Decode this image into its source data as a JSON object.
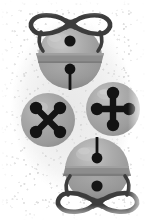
{
  "scene": {
    "title": "Jingle bells and buttons craft illustration",
    "description": "Grayscale illustration of two jingle bells tied with ribbon bows and two round four-hole buttons on a speckled light background",
    "width": 159,
    "height": 220,
    "style": "grayscale-halftone",
    "background": {
      "name": "speckled-paper-texture",
      "base_color": "#ffffff",
      "texture_color": "#eeeeee",
      "speckle_color": "#d6d6d6"
    },
    "palette": {
      "outline_dark": "#3a3a3a",
      "ink_black": "#141414",
      "metal_mid": "#9a9a9a",
      "metal_light": "#b4b4b4",
      "metal_highlight": "#c9c9c9",
      "metal_shadow": "#848484",
      "band_gray": "#8e8e8e",
      "button_face": "#a2a2a2",
      "button_face_light": "#b8b8b8",
      "paper_white": "#ffffff"
    },
    "objects": [
      {
        "id": "bell-top",
        "name": "jingle-bell-top",
        "label": "Jingle bell with bow (upright)",
        "type": "jingle-bell",
        "orientation": "upright",
        "center_x": 70,
        "center_y": 57,
        "radius": 32,
        "has_bow": true,
        "bow_position": "top",
        "parts": [
          "bow-ribbon",
          "bell-body",
          "bell-band",
          "hanger-hole",
          "clapper-stem",
          "clapper-ball"
        ]
      },
      {
        "id": "button-left",
        "name": "button-x-pattern",
        "label": "Four-hole button, X hole pattern",
        "type": "button",
        "hole_count": 4,
        "hole_pattern": "x-cross",
        "center_x": 47,
        "center_y": 119,
        "radius": 27,
        "parts": [
          "button-face",
          "hole-top-left",
          "hole-top-right",
          "hole-bottom-left",
          "hole-bottom-right",
          "thread-bar-a",
          "thread-bar-b"
        ]
      },
      {
        "id": "button-right",
        "name": "button-plus-pattern",
        "label": "Four-hole button, plus hole pattern",
        "type": "button",
        "hole_count": 4,
        "hole_pattern": "plus-cross",
        "center_x": 112,
        "center_y": 108,
        "radius": 27,
        "parts": [
          "button-face",
          "hole-top",
          "hole-bottom",
          "hole-left",
          "hole-right",
          "thread-bar-vertical",
          "thread-bar-horizontal"
        ]
      },
      {
        "id": "bell-bottom",
        "name": "jingle-bell-bottom",
        "label": "Jingle bell with bow (inverted)",
        "type": "jingle-bell",
        "orientation": "inverted",
        "center_x": 97,
        "center_y": 170,
        "radius": 32,
        "has_bow": true,
        "bow_position": "bottom",
        "parts": [
          "bow-ribbon",
          "bell-body",
          "bell-band",
          "hanger-hole",
          "clapper-stem",
          "clapper-ball"
        ]
      }
    ]
  }
}
